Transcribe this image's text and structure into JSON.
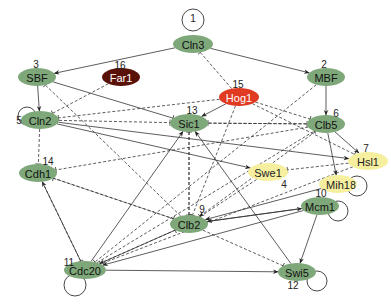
{
  "colors": {
    "green": "#7fa87a",
    "yellow": "#f6efa0",
    "red": "#e03a22",
    "darkred": "#5a1208",
    "edge": "#333333"
  },
  "nodes": [
    {
      "id": "Cln3",
      "num": "1",
      "x": 193,
      "y": 44,
      "color": "green",
      "rx": 20,
      "ry": 9,
      "nx": 193,
      "ny": 18,
      "text": "#111"
    },
    {
      "id": "MBF",
      "num": "2",
      "x": 326,
      "y": 77,
      "color": "green",
      "rx": 19,
      "ry": 9,
      "nx": 324,
      "ny": 64,
      "text": "#111"
    },
    {
      "id": "SBF",
      "num": "3",
      "x": 37,
      "y": 77,
      "color": "green",
      "rx": 19,
      "ry": 9,
      "nx": 36,
      "ny": 64,
      "text": "#111"
    },
    {
      "id": "Swe1",
      "num": "4",
      "x": 268,
      "y": 172,
      "color": "yellow",
      "rx": 20,
      "ry": 9,
      "nx": 284,
      "ny": 184,
      "text": "#222"
    },
    {
      "id": "Cln2",
      "num": "5",
      "x": 40,
      "y": 120,
      "color": "green",
      "rx": 19,
      "ry": 9,
      "nx": 19,
      "ny": 120,
      "text": "#111"
    },
    {
      "id": "Clb5",
      "num": "6",
      "x": 326,
      "y": 124,
      "color": "green",
      "rx": 19,
      "ry": 9,
      "nx": 336,
      "ny": 113,
      "text": "#111"
    },
    {
      "id": "Hsl1",
      "num": "7",
      "x": 368,
      "y": 161,
      "color": "yellow",
      "rx": 20,
      "ry": 9,
      "nx": 366,
      "ny": 148,
      "text": "#222"
    },
    {
      "id": "Mih1",
      "num": "8",
      "x": 338,
      "y": 184,
      "color": "yellow",
      "rx": 19,
      "ry": 9,
      "nx": 353,
      "ny": 185,
      "text": "#222"
    },
    {
      "id": "Clb2",
      "num": "9",
      "x": 189,
      "y": 224,
      "color": "green",
      "rx": 19,
      "ry": 9,
      "nx": 202,
      "ny": 209,
      "text": "#111"
    },
    {
      "id": "Mcm1",
      "num": "10",
      "x": 320,
      "y": 206,
      "color": "green",
      "rx": 19,
      "ry": 9,
      "nx": 321,
      "ny": 193,
      "text": "#111"
    },
    {
      "id": "Cdc20",
      "num": "11",
      "x": 85,
      "y": 270,
      "color": "green",
      "rx": 21,
      "ry": 9,
      "nx": 69,
      "ny": 262,
      "text": "#111"
    },
    {
      "id": "Swi5",
      "num": "12",
      "x": 297,
      "y": 272,
      "color": "green",
      "rx": 19,
      "ry": 9,
      "nx": 293,
      "ny": 285,
      "text": "#111"
    },
    {
      "id": "Sic1",
      "num": "13",
      "x": 189,
      "y": 123,
      "color": "green",
      "rx": 19,
      "ry": 9,
      "nx": 192,
      "ny": 110,
      "text": "#111"
    },
    {
      "id": "Cdh1",
      "num": "14",
      "x": 38,
      "y": 173,
      "color": "green",
      "rx": 19,
      "ry": 9,
      "nx": 48,
      "ny": 161,
      "text": "#111"
    },
    {
      "id": "Hog1",
      "num": "15",
      "x": 239,
      "y": 97,
      "color": "red",
      "rx": 20,
      "ry": 9,
      "nx": 238,
      "ny": 84,
      "text": "#fff"
    },
    {
      "id": "Far1",
      "num": "16",
      "x": 121,
      "y": 77,
      "color": "darkred",
      "rx": 19,
      "ry": 9,
      "nx": 120,
      "ny": 65,
      "text": "#fff"
    }
  ],
  "edges": [
    {
      "from": "Cln3",
      "to": "SBF",
      "type": "activate",
      "style": "solid"
    },
    {
      "from": "Cln3",
      "to": "MBF",
      "type": "activate",
      "style": "solid"
    },
    {
      "from": "SBF",
      "to": "Cln2",
      "type": "activate",
      "style": "solid"
    },
    {
      "from": "MBF",
      "to": "Clb5",
      "type": "activate",
      "style": "solid"
    },
    {
      "from": "Far1",
      "to": "Cln2",
      "type": "inhibit",
      "style": "dashed"
    },
    {
      "from": "Hog1",
      "to": "Cln3",
      "type": "inhibit",
      "style": "dashed"
    },
    {
      "from": "Hog1",
      "to": "Sic1",
      "type": "activate",
      "style": "solid"
    },
    {
      "from": "Hog1",
      "to": "Cln2",
      "type": "inhibit",
      "style": "dashed"
    },
    {
      "from": "Hog1",
      "to": "Clb5",
      "type": "inhibit",
      "style": "dashed"
    },
    {
      "from": "Hog1",
      "to": "Clb2",
      "type": "inhibit",
      "style": "dashed"
    },
    {
      "from": "Hog1",
      "to": "Hsl1",
      "type": "inhibit",
      "style": "dashed"
    },
    {
      "from": "SBF",
      "to": "Sic1",
      "type": "inhibit",
      "style": "solid"
    },
    {
      "from": "Clb2",
      "to": "SBF",
      "type": "inhibit",
      "style": "dashed"
    },
    {
      "from": "Cln2",
      "to": "Sic1",
      "type": "inhibit",
      "style": "dashed"
    },
    {
      "from": "Cln2",
      "to": "Swe1",
      "type": "activate",
      "style": "solid"
    },
    {
      "from": "Cln2",
      "to": "Hsl1",
      "type": "activate",
      "style": "solid"
    },
    {
      "from": "Cln2",
      "to": "Cdh1",
      "type": "inhibit",
      "style": "dashed"
    },
    {
      "from": "Clb5",
      "to": "Sic1",
      "type": "inhibit",
      "style": "dashed"
    },
    {
      "from": "Sic1",
      "to": "Clb5",
      "type": "inhibit",
      "style": "dashed"
    },
    {
      "from": "Clb5",
      "to": "Hsl1",
      "type": "activate",
      "style": "solid"
    },
    {
      "from": "Clb5",
      "to": "Mih1",
      "type": "activate",
      "style": "solid"
    },
    {
      "from": "Clb5",
      "to": "Cdh1",
      "type": "inhibit",
      "style": "dashed"
    },
    {
      "from": "Clb5",
      "to": "Clb2",
      "type": "activate",
      "style": "dashed"
    },
    {
      "from": "Sic1",
      "to": "Clb2",
      "type": "inhibit",
      "style": "dashed"
    },
    {
      "from": "Clb2",
      "to": "Sic1",
      "type": "inhibit",
      "style": "dashed"
    },
    {
      "from": "Swe1",
      "to": "Clb2",
      "type": "inhibit",
      "style": "dashed"
    },
    {
      "from": "Hsl1",
      "to": "Swe1",
      "type": "inhibit",
      "style": "dashed"
    },
    {
      "from": "Mih1",
      "to": "Clb2",
      "type": "activate",
      "style": "solid"
    },
    {
      "from": "Clb2",
      "to": "Mcm1",
      "type": "activate",
      "style": "solid"
    },
    {
      "from": "Mcm1",
      "to": "Clb2",
      "type": "activate",
      "style": "solid"
    },
    {
      "from": "Mcm1",
      "to": "Cdc20",
      "type": "activate",
      "style": "solid"
    },
    {
      "from": "Mcm1",
      "to": "Swi5",
      "type": "activate",
      "style": "solid"
    },
    {
      "from": "Clb2",
      "to": "Cdh1",
      "type": "inhibit",
      "style": "dashed"
    },
    {
      "from": "Cdh1",
      "to": "Clb2",
      "type": "inhibit",
      "style": "dashed"
    },
    {
      "from": "Clb2",
      "to": "Cdc20",
      "type": "activate",
      "style": "solid"
    },
    {
      "from": "Clb2",
      "to": "Swi5",
      "type": "inhibit",
      "style": "dashed"
    },
    {
      "from": "Cdc20",
      "to": "Cdh1",
      "type": "activate",
      "style": "solid"
    },
    {
      "from": "Cdc20",
      "to": "Sic1",
      "type": "activate",
      "style": "solid"
    },
    {
      "from": "Cdc20",
      "to": "Swi5",
      "type": "activate",
      "style": "solid"
    },
    {
      "from": "Cdc20",
      "to": "Clb2",
      "type": "inhibit",
      "style": "dashed"
    },
    {
      "from": "Cdc20",
      "to": "Clb5",
      "type": "inhibit",
      "style": "dashed"
    },
    {
      "from": "Swi5",
      "to": "Sic1",
      "type": "activate",
      "style": "solid"
    },
    {
      "from": "Hsl1",
      "to": "Cdc20",
      "type": "inhibit",
      "style": "dashed"
    },
    {
      "from": "Cdh1",
      "to": "Cdc20",
      "type": "inhibit",
      "style": "dashed"
    },
    {
      "from": "MBF",
      "to": "Cdc20",
      "type": "inhibit",
      "style": "dashed"
    }
  ],
  "self_loops": [
    {
      "node": "Cln3",
      "cx": 193,
      "cy": 20,
      "r": 11
    },
    {
      "node": "Cln2",
      "cx": 27,
      "cy": 116,
      "r": 9
    },
    {
      "node": "Mih1",
      "cx": 357,
      "cy": 186,
      "r": 10
    },
    {
      "node": "Mcm1",
      "cx": 338,
      "cy": 211,
      "r": 10
    },
    {
      "node": "Cdc20",
      "cx": 75,
      "cy": 285,
      "r": 11
    },
    {
      "node": "Swi5",
      "cx": 317,
      "cy": 281,
      "r": 10
    }
  ]
}
